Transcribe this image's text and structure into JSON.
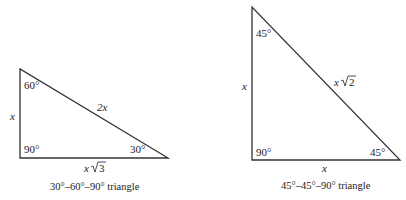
{
  "diagram": {
    "triangle_30_60_90": {
      "caption": "30°–60°–90° triangle",
      "angles": {
        "top": "60°",
        "right_angle": "90°",
        "bottom_right": "30°"
      },
      "sides": {
        "short_leg": "x",
        "hypotenuse": "2x",
        "long_leg_var": "x",
        "long_leg_root": "3"
      }
    },
    "triangle_45_45_90": {
      "caption": "45°–45°–90° triangle",
      "angles": {
        "top": "45°",
        "right_angle": "90°",
        "bottom_right": "45°"
      },
      "sides": {
        "leg_vertical": "x",
        "leg_horizontal": "x",
        "hypotenuse_var": "x",
        "hypotenuse_root": "2"
      }
    },
    "colors": {
      "stroke": "#333333",
      "text": "#222222",
      "background": "#ffffff"
    }
  }
}
